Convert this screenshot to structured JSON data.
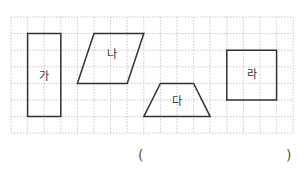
{
  "grid": {
    "origin_x": 11,
    "origin_y": 17,
    "cell": 16.6,
    "cols": 17,
    "rows": 7,
    "line_color": "#b9b9b9"
  },
  "shapes": [
    {
      "id": "ga",
      "label": "가",
      "type": "rectangle",
      "points": [
        [
          1,
          1
        ],
        [
          3,
          1
        ],
        [
          3,
          6
        ],
        [
          1,
          6
        ]
      ],
      "label_pos": [
        2,
        3.6
      ]
    },
    {
      "id": "na",
      "label": "나",
      "type": "parallelogram",
      "points": [
        [
          5,
          1
        ],
        [
          8,
          1
        ],
        [
          7,
          4
        ],
        [
          4,
          4
        ]
      ],
      "label_pos": [
        6.1,
        2.3
      ]
    },
    {
      "id": "da",
      "label": "다",
      "type": "trapezoid",
      "points": [
        [
          9,
          4
        ],
        [
          11,
          4
        ],
        [
          12,
          6
        ],
        [
          8,
          6
        ]
      ],
      "label_pos": [
        10,
        5.1
      ]
    },
    {
      "id": "ra",
      "label": "라",
      "type": "square",
      "points": [
        [
          13,
          2
        ],
        [
          16,
          2
        ],
        [
          16,
          5
        ],
        [
          13,
          5
        ]
      ],
      "label_pos": [
        14.5,
        3.5
      ]
    }
  ],
  "answer": {
    "open": "(",
    "close": ")"
  },
  "colors": {
    "shape_stroke": "#333333",
    "label": "#333333"
  }
}
